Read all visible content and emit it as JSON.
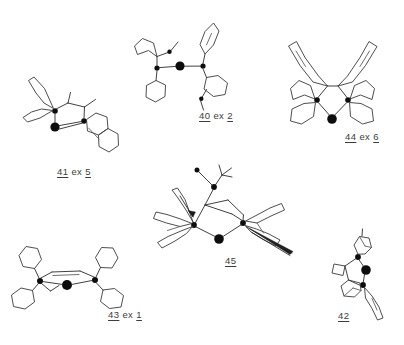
{
  "page": {
    "background_color": "#ffffff",
    "ink_color": "#2b2b2b",
    "atom_color": "#0d0d0d",
    "label_color": "#3d3d3d",
    "width": 404,
    "height": 345,
    "kind": "chemical-structure-plate"
  },
  "structures": [
    {
      "id": "40",
      "number": "40",
      "ex_prefix": "ex",
      "ex_number": "2",
      "label_x": 199,
      "label_y": 110,
      "description": "Bidentate bis-phosphine metal complex with two cyclohexyl rings, two aryl rings and two methoxy groups",
      "metal_atoms": 1,
      "phosphorus_atoms": 2
    },
    {
      "id": "41",
      "number": "41",
      "ex_prefix": "ex",
      "ex_number": "5",
      "label_x": 57,
      "label_y": 166,
      "description": "Bis-phosphine metal complex with fused ring cage and methyl substituents",
      "metal_atoms": 1,
      "phosphorus_atoms": 2
    },
    {
      "id": "42",
      "number": "42",
      "ex_prefix": "",
      "ex_number": "",
      "label_x": 338,
      "label_y": 310,
      "description": "Bicyclic phosphine metal complex with bridged cage rings",
      "metal_atoms": 1,
      "phosphorus_atoms": 2
    },
    {
      "id": "43",
      "number": "43",
      "ex_prefix": "ex",
      "ex_number": "1",
      "label_x": 108,
      "label_y": 309,
      "description": "Symmetric tetra-cyclohexyl bis-phosphine metal complex with ethylene bridge",
      "metal_atoms": 1,
      "phosphorus_atoms": 2
    },
    {
      "id": "44",
      "number": "44",
      "ex_prefix": "ex",
      "ex_number": "6",
      "label_x": 345,
      "label_y": 131,
      "description": "Symmetric bis-phosphine metal complex with biaryl backbone and four rings",
      "metal_atoms": 1,
      "phosphorus_atoms": 2
    },
    {
      "id": "45",
      "number": "45",
      "ex_prefix": "",
      "ex_number": "",
      "label_x": 225,
      "label_y": 255,
      "description": "Caged bis-phosphine metal complex with tert-butyl group and wedge bonds",
      "metal_atoms": 1,
      "phosphorus_atoms": 3
    }
  ]
}
